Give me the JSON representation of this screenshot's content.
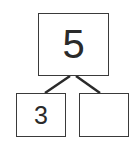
{
  "number_bond": {
    "whole": "5",
    "parts": [
      "3",
      ""
    ]
  }
}
